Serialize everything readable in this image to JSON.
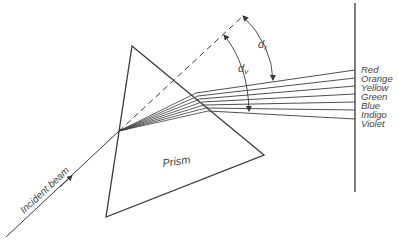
{
  "diagram": {
    "labels": {
      "prism": "Prism",
      "incident_beam": "Incident beam",
      "d_r": "d",
      "d_r_sub": "r",
      "d_v": "d",
      "d_v_sub": "v"
    },
    "spectrum": [
      {
        "name": "Red",
        "screen_y": 70
      },
      {
        "name": "Orange",
        "screen_y": 78
      },
      {
        "name": "Yellow",
        "screen_y": 86
      },
      {
        "name": "Green",
        "screen_y": 94
      },
      {
        "name": "Blue",
        "screen_y": 102
      },
      {
        "name": "Indigo",
        "screen_y": 110
      },
      {
        "name": "Violet",
        "screen_y": 119
      }
    ],
    "colors": {
      "line": "#3a3a3a",
      "text": "#444444",
      "background": "#ffffff"
    }
  }
}
